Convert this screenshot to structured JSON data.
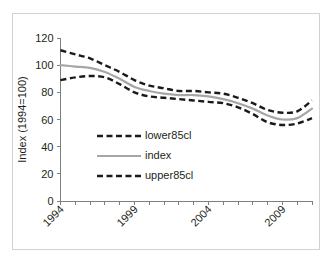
{
  "chart_data": {
    "type": "line",
    "title": "",
    "xlabel": "",
    "ylabel": "Index (1994=100)",
    "ylim": [
      0,
      120
    ],
    "ytick_labels": [
      "0",
      "20",
      "40",
      "60",
      "80",
      "100",
      "120"
    ],
    "yticks": [
      0,
      20,
      40,
      60,
      80,
      100,
      120
    ],
    "xlim": [
      1994,
      2011
    ],
    "xtick_labels": [
      "1994",
      "1999",
      "2004",
      "2009"
    ],
    "xticks": [
      1994,
      1999,
      2004,
      2009
    ],
    "x": [
      1994,
      1995,
      1996,
      1997,
      1998,
      1999,
      2000,
      2001,
      2002,
      2003,
      2004,
      2005,
      2006,
      2007,
      2008,
      2009,
      2010,
      2011
    ],
    "grid": false,
    "legend_position": "center-left",
    "series": [
      {
        "name": "lower85cl",
        "style": "dashed",
        "color": "#1a1a1a",
        "values": [
          89,
          91,
          92,
          91,
          86,
          80,
          77,
          76,
          75,
          74,
          73,
          72,
          69,
          64,
          58,
          56,
          57,
          61
        ]
      },
      {
        "name": "index",
        "style": "solid",
        "color": "#a6a6a6",
        "values": [
          100,
          99,
          98,
          95,
          90,
          84,
          81,
          79,
          78,
          78,
          77,
          75,
          72,
          68,
          63,
          60,
          61,
          68
        ]
      },
      {
        "name": "upper85cl",
        "style": "dashed",
        "color": "#1a1a1a",
        "values": [
          111,
          108,
          105,
          100,
          95,
          89,
          85,
          83,
          81,
          81,
          80,
          79,
          76,
          72,
          67,
          65,
          66,
          74
        ]
      }
    ],
    "legend_entries": [
      {
        "label": "lower85cl",
        "style": "dashed",
        "color": "#1a1a1a"
      },
      {
        "label": "index",
        "style": "solid",
        "color": "#a6a6a6"
      },
      {
        "label": "upper85cl",
        "style": "dashed",
        "color": "#1a1a1a"
      }
    ]
  },
  "colors": {
    "band": "#1a1a1a",
    "index": "#a6a6a6",
    "axis": "#7f7f7f",
    "frame": "#d2d2d2",
    "text": "#231f20",
    "background": "#ffffff"
  }
}
